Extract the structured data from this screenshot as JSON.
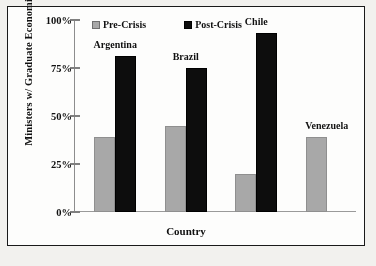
{
  "figure": {
    "background_color": "#f2f1ee",
    "plot_background": "#fdfdfc",
    "border_color": "#1a1a1a"
  },
  "legend": {
    "position": "top-left-inside",
    "entries": [
      {
        "label": "Pre-Crisis",
        "color": "#a8a8a8",
        "swatch": "gray-square-swatch"
      },
      {
        "label": "Post-Crisis",
        "color": "#0d0d0d",
        "swatch": "black-square-swatch"
      }
    ]
  },
  "chart_data": {
    "type": "bar",
    "title": "",
    "xlabel": "Country",
    "ylabel": "Ministers w/ Graduate Economics Degrees",
    "categories": [
      "Argentina",
      "Brazil",
      "Chile",
      "Venezuela"
    ],
    "series": [
      {
        "name": "Pre-Crisis",
        "color": "#a8a8a8",
        "values": [
          39,
          45,
          20,
          39
        ]
      },
      {
        "name": "Post-Crisis",
        "color": "#0d0d0d",
        "values": [
          81,
          75,
          93,
          0
        ]
      }
    ],
    "ylim": [
      0,
      100
    ],
    "yticks": [
      0,
      25,
      50,
      75,
      100
    ],
    "ytick_labels": [
      "0%",
      "25%",
      "50%",
      "75%",
      "100%"
    ],
    "xtick_labels": [],
    "grid": false,
    "value_unit": "percent",
    "group_labels_above_bars": true
  }
}
